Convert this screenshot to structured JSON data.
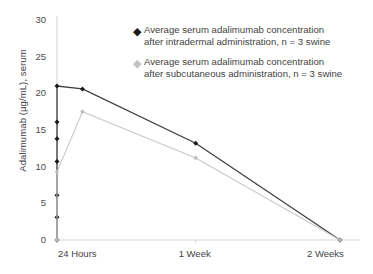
{
  "chart_data": {
    "type": "line",
    "title": "",
    "xlabel": "",
    "ylabel": "Adalimumab (µg/mL), serum",
    "ylim": [
      0,
      30
    ],
    "yticks": [
      0,
      5,
      10,
      15,
      20,
      25,
      30
    ],
    "ytick_labels": [
      "0",
      "5",
      "10",
      "15",
      "20",
      "25",
      "30"
    ],
    "xtick_labels": [
      "24 Hours",
      "1 Week",
      "2 Weeks"
    ],
    "grid": false,
    "legend_position": "upper-center-right",
    "series": [
      {
        "name": "Average serum adalimumab concentration after intradermal administration, n = 3 swine",
        "legend_line1": "Average serum adalimumab concentration",
        "legend_line2": "after intradermal administration, n = 3 swine",
        "color": "#3f3f3f",
        "marker": "diamond",
        "marker_color": "#1a1a1a",
        "points": [
          {
            "x": 0.0,
            "y": 0.0
          },
          {
            "x": 0.0,
            "y": 3.1
          },
          {
            "x": 0.0,
            "y": 6.1
          },
          {
            "x": 0.0,
            "y": 10.7
          },
          {
            "x": 0.0,
            "y": 13.8
          },
          {
            "x": 0.0,
            "y": 16.1
          },
          {
            "x": 0.0,
            "y": 21.0
          },
          {
            "x": 0.09,
            "y": 20.6
          },
          {
            "x": 0.49,
            "y": 13.2
          },
          {
            "x": 1.0,
            "y": 0.0
          }
        ]
      },
      {
        "name": "Average serum adalimumab concentration after subcutaneous administration, n = 3 swine",
        "legend_line1": "Average serum adalimumab concentration",
        "legend_line2": "after subcutaneous administration, n = 3 swine",
        "color": "#c9c9c9",
        "marker": "diamond",
        "marker_color": "#bdbdbd",
        "points": [
          {
            "x": 0.0,
            "y": 0.0
          },
          {
            "x": 0.0,
            "y": 9.3
          },
          {
            "x": 0.09,
            "y": 17.5
          },
          {
            "x": 0.49,
            "y": 11.2
          },
          {
            "x": 1.0,
            "y": 0.0
          }
        ]
      }
    ]
  },
  "legend": {
    "items": [
      {
        "marker": "diamond-dark",
        "line1": "Average serum adalimumab concentration",
        "line2": "after intradermal administration, n = 3 swine"
      },
      {
        "marker": "diamond-light",
        "line1": "Average serum adalimumab concentration",
        "line2": "after subcutaneous administration, n = 3 swine"
      }
    ]
  },
  "axes": {
    "y_title": "Adalimumab (µg/mL), serum"
  }
}
